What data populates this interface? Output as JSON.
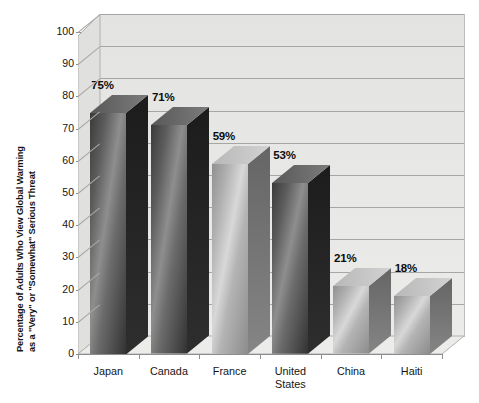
{
  "chart_data": {
    "type": "bar",
    "title": "",
    "xlabel": "",
    "ylabel": "Percentage of Adults Who View Global Warming as a \"Very\" or \"Somewhat\" Serious Threat",
    "ylabel_line1": "Percentage of Adults Who View Global Warming",
    "ylabel_line2": "as a \"Very\" or \"Somewhat\" Serious Threat",
    "categories": [
      "Japan",
      "Canada",
      "France",
      "United States",
      "China",
      "Haiti"
    ],
    "values": [
      75,
      71,
      59,
      53,
      21,
      18
    ],
    "value_labels": [
      "75%",
      "71%",
      "59%",
      "53%",
      "21%",
      "18%"
    ],
    "ylim": [
      0,
      100
    ],
    "ytick_values": [
      0,
      10,
      20,
      30,
      40,
      50,
      60,
      70,
      80,
      90,
      100
    ],
    "ytick_labels": [
      "0",
      "10",
      "20",
      "30",
      "40",
      "50",
      "60",
      "70",
      "80",
      "90",
      "100"
    ],
    "grid": true,
    "legend": false,
    "style": "3d-column",
    "colors": {
      "plot_background": "#e7e7e5",
      "gridline": "#a6a6a4",
      "axis": "#8d8d8d",
      "bar_dark_face_top": "#3c3c3c",
      "bar_dark_face_bottom": "#6e6e6e",
      "bar_light_face_top": "#9a9a9a",
      "bar_light_face_bottom": "#c4c4c4",
      "bar_side_dark": "#232323",
      "bar_side_light": "#6b6b6b",
      "text": "#141414"
    },
    "bar_shades": [
      "dark",
      "dark",
      "light",
      "dark",
      "light",
      "light"
    ]
  }
}
